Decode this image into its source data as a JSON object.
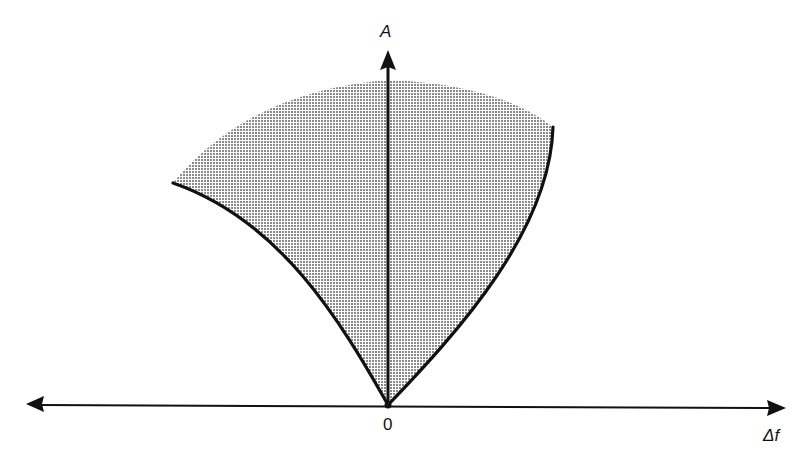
{
  "diagram": {
    "title": "",
    "axes": {
      "y_label": "A",
      "x_label": "Δf",
      "origin_label": "0"
    },
    "region": {
      "description": "Shaded stippled region bounded by two curves from the origin and an arc across the top",
      "fill_color": "#bdbdbd",
      "stroke_color": "#111111"
    },
    "colors": {
      "ink": "#111111",
      "background": "#ffffff",
      "shade": "#bdbdbd"
    }
  }
}
